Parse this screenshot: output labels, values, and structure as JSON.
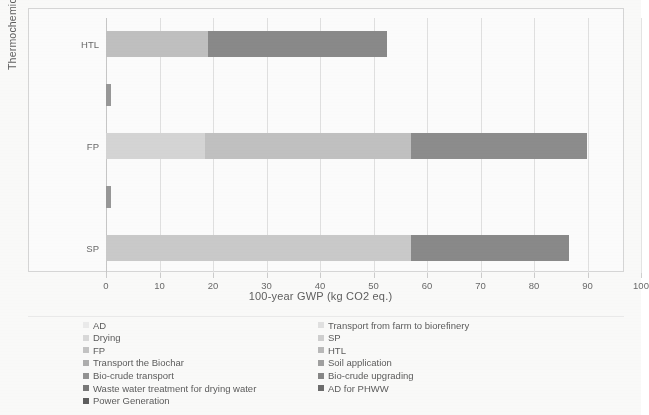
{
  "chart_data": {
    "type": "bar",
    "orientation": "horizontal",
    "stacked": true,
    "title": "",
    "xlabel": "100-year GWP (kg CO2 eq.)",
    "ylabel": "Thermochemical Technology",
    "xlim": [
      0,
      100
    ],
    "xticks": [
      0,
      10,
      20,
      30,
      40,
      50,
      60,
      70,
      80,
      90,
      100
    ],
    "xtick_labels": [
      "0",
      "10",
      "20",
      "30",
      "40",
      "50",
      "60",
      "70",
      "80",
      "90",
      "100"
    ],
    "grid": "vertical",
    "legend_position": "bottom",
    "categories": [
      "HTL",
      "",
      "FP",
      "",
      "SP"
    ],
    "visible_category_labels": [
      "HTL",
      "FP",
      "SP"
    ],
    "series": [
      {
        "name": "AD",
        "color": "#eeeeee",
        "values": [
          0,
          0,
          0,
          0,
          0
        ]
      },
      {
        "name": "Transport from farm to biorefinery",
        "color": "#e4e4e4",
        "values": [
          0,
          0,
          0,
          0,
          0
        ]
      },
      {
        "name": "Drying",
        "color": "#dcdcdc",
        "values": [
          0,
          0,
          18.5,
          0,
          0
        ]
      },
      {
        "name": "SP",
        "color": "#d2d2d2",
        "values": [
          0,
          0,
          0,
          0,
          57.0
        ]
      },
      {
        "name": "FP",
        "color": "#c6c6c6",
        "values": [
          0,
          0,
          0,
          0,
          0
        ]
      },
      {
        "name": "HTL",
        "color": "#bcbcbc",
        "values": [
          19.0,
          0,
          0,
          0,
          0
        ]
      },
      {
        "name": "Transport the Biochar",
        "color": "#b0b0b0",
        "values": [
          0,
          1.0,
          0,
          1.0,
          0
        ]
      },
      {
        "name": "Soil application",
        "color": "#a2a2a2",
        "values": [
          0,
          0,
          0,
          0,
          0
        ]
      },
      {
        "name": "Bio-crude transport",
        "color": "#949494",
        "values": [
          0,
          0,
          38.5,
          0,
          0
        ]
      },
      {
        "name": "Bio-crude upgrading",
        "color": "#888888",
        "values": [
          33.5,
          0,
          0,
          0,
          29.5
        ]
      },
      {
        "name": "Waste water treatment for drying water",
        "color": "#7a7a7a",
        "values": [
          0,
          0,
          33.0,
          0,
          0
        ]
      },
      {
        "name": "AD for PHWW",
        "color": "#6e6e6e",
        "values": [
          0,
          0,
          0,
          0,
          0
        ]
      },
      {
        "name": "Power Generation",
        "color": "#5f5f5f",
        "values": [
          0,
          0,
          0,
          0,
          0
        ]
      }
    ],
    "bars": [
      {
        "category": "HTL",
        "total": 52.5,
        "segments": [
          {
            "name": "HTL",
            "start": 0,
            "value": 19.0,
            "color": "#c2c2c2"
          },
          {
            "name": "Bio-crude upgrading",
            "start": 19.0,
            "value": 33.5,
            "color": "#8b8b8b"
          }
        ]
      },
      {
        "category": "",
        "total": 1.0,
        "segments": [
          {
            "name": "Transport the Biochar",
            "start": 0,
            "value": 1.0,
            "color": "#9a9a9a"
          }
        ]
      },
      {
        "category": "FP",
        "total": 90.0,
        "segments": [
          {
            "name": "Drying",
            "start": 0,
            "value": 18.5,
            "color": "#d8d8d8"
          },
          {
            "name": "Bio-crude transport",
            "start": 18.5,
            "value": 38.5,
            "color": "#c3c3c3"
          },
          {
            "name": "Waste water treatment for drying water",
            "start": 57.0,
            "value": 33.0,
            "color": "#8e8e8e"
          }
        ]
      },
      {
        "category": "",
        "total": 1.0,
        "segments": [
          {
            "name": "Transport the Biochar",
            "start": 0,
            "value": 1.0,
            "color": "#9a9a9a"
          }
        ]
      },
      {
        "category": "SP",
        "total": 86.5,
        "segments": [
          {
            "name": "SP",
            "start": 0,
            "value": 57.0,
            "color": "#cccccc"
          },
          {
            "name": "Bio-crude upgrading",
            "start": 57.0,
            "value": 29.5,
            "color": "#8b8b8b"
          }
        ]
      }
    ],
    "legend": {
      "left_column": [
        {
          "label": "AD",
          "color": "#eeeeee"
        },
        {
          "label": "Drying",
          "color": "#dcdcdc"
        },
        {
          "label": "FP",
          "color": "#c6c6c6"
        },
        {
          "label": "Transport the Biochar",
          "color": "#b0b0b0"
        },
        {
          "label": "Bio-crude transport",
          "color": "#949494"
        },
        {
          "label": "Waste water treatment for drying water",
          "color": "#7a7a7a"
        },
        {
          "label": "Power Generation",
          "color": "#5f5f5f"
        }
      ],
      "right_column": [
        {
          "label": "Transport from farm to biorefinery",
          "color": "#e4e4e4"
        },
        {
          "label": "SP",
          "color": "#d2d2d2"
        },
        {
          "label": "HTL",
          "color": "#bcbcbc"
        },
        {
          "label": "Soil application",
          "color": "#a2a2a2"
        },
        {
          "label": "Bio-crude upgrading",
          "color": "#888888"
        },
        {
          "label": "AD for PHWW",
          "color": "#6e6e6e"
        }
      ]
    }
  }
}
